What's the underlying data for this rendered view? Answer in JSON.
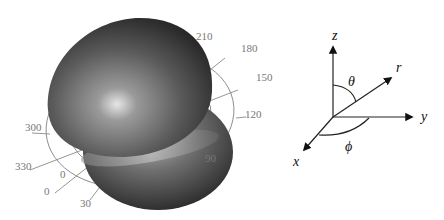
{
  "figure": {
    "orbital_plot": {
      "angle_ticks": [
        {
          "label": "210",
          "x": 196,
          "y": 40
        },
        {
          "label": "180",
          "x": 241,
          "y": 52
        },
        {
          "label": "150",
          "x": 256,
          "y": 81
        },
        {
          "label": "120",
          "x": 245,
          "y": 118
        },
        {
          "label": "90",
          "x": 205,
          "y": 162
        },
        {
          "label": "300",
          "x": 25,
          "y": 131
        },
        {
          "label": "330",
          "x": 15,
          "y": 170
        },
        {
          "label": "0",
          "x": 60,
          "y": 178
        },
        {
          "label": "0",
          "x": 44,
          "y": 195
        },
        {
          "label": "30",
          "x": 80,
          "y": 207
        }
      ]
    },
    "coordinate_system": {
      "axes": [
        {
          "name": "z",
          "label": "z"
        },
        {
          "name": "y",
          "label": "y"
        },
        {
          "name": "x",
          "label": "x"
        },
        {
          "name": "r",
          "label": "r"
        }
      ],
      "angles": [
        {
          "name": "theta",
          "label": "θ"
        },
        {
          "name": "phi",
          "label": "ϕ"
        }
      ]
    }
  }
}
